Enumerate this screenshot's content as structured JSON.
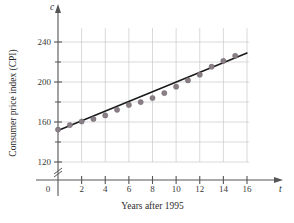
{
  "chart_data": {
    "type": "scatter",
    "title": "",
    "xlabel": "Years after 1995",
    "ylabel": "Consumer price index (CPI)",
    "x_axis_variable": "t",
    "y_axis_variable": "c",
    "xlim": [
      0,
      16
    ],
    "ylim": [
      120,
      250
    ],
    "y_axis_break": true,
    "y_axis_break_symbol": "≈",
    "grid": true,
    "legend_position": "none",
    "x_ticks": [
      0,
      2,
      4,
      6,
      8,
      10,
      12,
      14,
      16
    ],
    "x_tick_labels": [
      "0",
      "2",
      "4",
      "6",
      "8",
      "10",
      "12",
      "14",
      "16"
    ],
    "x_minor_ticks": [
      1,
      3,
      5,
      7,
      9,
      11,
      13,
      15
    ],
    "y_ticks": [
      120,
      160,
      200,
      240
    ],
    "y_tick_labels": [
      "120",
      "160",
      "200",
      "240"
    ],
    "y_minor_ticks": [
      140,
      180,
      220
    ],
    "point_color": "#8a7f86",
    "line_color": "#1a1a1a",
    "grid_color": "#c9c9c9",
    "axis_color": "#555555",
    "series": [
      {
        "name": "Consumer price index (CPI)",
        "kind": "scatter",
        "x": [
          0,
          1,
          2,
          3,
          4,
          5,
          6,
          7,
          8,
          9,
          10,
          11,
          12,
          13,
          14,
          15
        ],
        "values": [
          152.4,
          156.9,
          160.5,
          163.0,
          166.6,
          172.2,
          177.1,
          179.9,
          184.0,
          188.9,
          195.3,
          201.6,
          207.3,
          215.3,
          221.1,
          226.2
        ]
      },
      {
        "name": "Linear regression line",
        "kind": "line",
        "x": [
          0,
          16
        ],
        "values": [
          151.5,
          229.0
        ]
      }
    ]
  }
}
